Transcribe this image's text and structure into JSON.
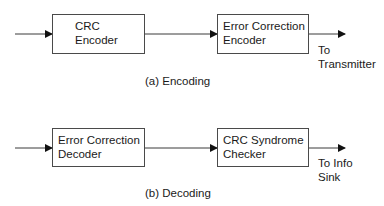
{
  "encoding": {
    "blocks": [
      {
        "line1": "CRC",
        "line2": "Encoder"
      },
      {
        "line1": "Error Correction",
        "line2": "Encoder"
      }
    ],
    "output_label": {
      "line1": "To",
      "line2": "Transmitter"
    },
    "caption": "(a) Encoding"
  },
  "decoding": {
    "blocks": [
      {
        "line1": "Error Correction",
        "line2": "Decoder"
      },
      {
        "line1": "CRC Syndrome",
        "line2": "Checker"
      }
    ],
    "output_label": {
      "line1": "To Info",
      "line2": "Sink"
    },
    "caption": "(b) Decoding"
  },
  "colors": {
    "line": "#3a3a3a",
    "border": "#4a4a4a",
    "text": "#1a1a1a"
  }
}
